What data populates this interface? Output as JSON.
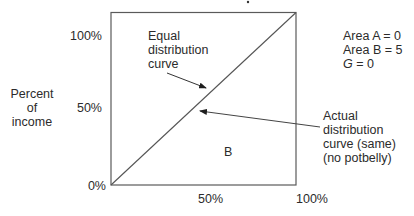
{
  "figure": {
    "type": "lorenz_curve_diagram",
    "y_axis_label": [
      "Percent",
      "of",
      "income"
    ],
    "y_ticks": [
      "100%",
      "50%",
      "0%"
    ],
    "x_ticks": [
      "50%",
      "100%"
    ],
    "equal_distribution_label": [
      "Equal",
      "distribution",
      "curve"
    ],
    "actual_distribution_label": [
      "Actual",
      "distribution",
      "curve (same)",
      "(no potbelly)"
    ],
    "area_label_b": "B",
    "stats": {
      "area_a": "Area A = 0",
      "area_b": "Area B = 5",
      "g_symbol": "G",
      "g_value": " = 0"
    }
  },
  "colors": {
    "line": "#5a5a5a",
    "text": "#2b2b2b",
    "background": "#ffffff"
  }
}
